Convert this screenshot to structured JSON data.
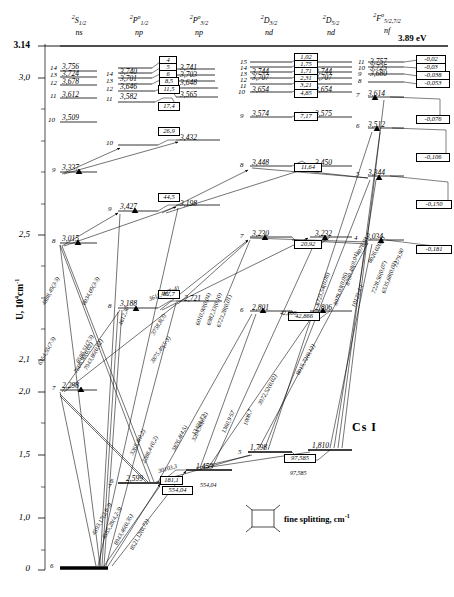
{
  "title": "Cs I",
  "axis": {
    "title": "U, 10⁴ cm⁻¹",
    "ticks": [
      "3.14",
      "3,0",
      "2,5",
      "2,1",
      "2,0",
      "1,5",
      "1,0",
      "0"
    ],
    "ionization_energy": "3.89 eV"
  },
  "legend": {
    "symbol": "fine-splitting-box",
    "text": "fine splitting, cm",
    "exp": "-1"
  },
  "columns": [
    {
      "term": "2S1/2",
      "term_sup": "2",
      "term_letter": "S",
      "term_sub": "1/2",
      "conf": "ns"
    },
    {
      "term": "2P°1/2",
      "term_sup": "2",
      "term_letter": "P",
      "term_sub": "1/2",
      "conf": "np"
    },
    {
      "term": "2P°3/2",
      "term_sup": "2",
      "term_letter": "P",
      "term_sub": "3/2",
      "conf": "np"
    },
    {
      "term": "2D3/2",
      "term_sup": "2",
      "term_letter": "D",
      "term_sub": "3/2",
      "conf": "nd"
    },
    {
      "term": "2D5/2",
      "term_sup": "2",
      "term_letter": "D",
      "term_sub": "5/2",
      "conf": "nd"
    },
    {
      "term": "2F°5/2,7/2",
      "term_sup": "2",
      "term_letter": "F",
      "term_sub": "5/2,7/2",
      "conf": "nf"
    }
  ],
  "levels": {
    "ns": [
      {
        "n": "14",
        "value": "3,756"
      },
      {
        "n": "13",
        "value": "3,724"
      },
      {
        "n": "12",
        "value": "3,678"
      },
      {
        "n": "11",
        "value": "3,612"
      },
      {
        "n": "10",
        "value": "3,509"
      },
      {
        "n": "9",
        "value": "3,337"
      },
      {
        "n": "8",
        "value": "3,015"
      },
      {
        "n": "7",
        "value": "2,298"
      },
      {
        "n": "6",
        "value": ""
      }
    ],
    "np12": [
      {
        "n": "14",
        "value": "3,740"
      },
      {
        "n": "13",
        "value": "3,701"
      },
      {
        "n": "12",
        "value": "3,646"
      },
      {
        "n": "11",
        "value": "3,582"
      },
      {
        "n": "10",
        "value": ""
      },
      {
        "n": "9",
        "value": "3,427"
      },
      {
        "n": "8",
        "value": "3,188"
      },
      {
        "n": "7",
        "value": "2,599"
      },
      {
        "n": "6",
        "value": "1,386"
      }
    ],
    "np32": [
      {
        "n": "",
        "value": "3,741"
      },
      {
        "n": "",
        "value": "3,703"
      },
      {
        "n": "",
        "value": "3,648"
      },
      {
        "n": "",
        "value": "3,565"
      },
      {
        "n": "",
        "value": "3,432"
      },
      {
        "n": "",
        "value": "3,198"
      },
      {
        "n": "",
        "value": "2,721"
      },
      {
        "n": "",
        "value": "1,453"
      }
    ],
    "nd32": [
      {
        "n": "15",
        "value": ""
      },
      {
        "n": "14",
        "value": ""
      },
      {
        "n": "13",
        "value": "3,744"
      },
      {
        "n": "12",
        "value": "3,707"
      },
      {
        "n": "11",
        "value": ""
      },
      {
        "n": "10",
        "value": "3,654"
      },
      {
        "n": "9",
        "value": "3,574"
      },
      {
        "n": "8",
        "value": "3,448"
      },
      {
        "n": "7",
        "value": "3,230"
      },
      {
        "n": "6",
        "value": "2,801"
      },
      {
        "n": "5",
        "value": "1,798"
      }
    ],
    "nd52": [
      {
        "n": "",
        "value": "3,744"
      },
      {
        "n": "",
        "value": "3,707"
      },
      {
        "n": "",
        "value": "3,654"
      },
      {
        "n": "",
        "value": "3,575"
      },
      {
        "n": "",
        "value": "3,450"
      },
      {
        "n": "",
        "value": "3,232"
      },
      {
        "n": "",
        "value": "2,806"
      },
      {
        "n": "",
        "value": "1,810"
      }
    ],
    "nf": [
      {
        "n": "11",
        "value": "3,757"
      },
      {
        "n": "10",
        "value": "3,725"
      },
      {
        "n": "9",
        "value": "3,680"
      },
      {
        "n": "8",
        "value": ""
      },
      {
        "n": "7",
        "value": "3,614"
      },
      {
        "n": "6",
        "value": "3,512"
      },
      {
        "n": "5",
        "value": "3,344"
      },
      {
        "n": "4",
        "value": "3,034"
      }
    ]
  },
  "fine_splitting": {
    "np": [
      "4",
      "5",
      "6",
      "8,5",
      "11,5",
      "17,4",
      "26,9",
      "44,5",
      "82,7",
      "181,1",
      "554,04"
    ],
    "nd": [
      "1,02",
      "1,75",
      "1,71",
      "2,31",
      "3,21",
      "4,85",
      "7,17",
      "11,64",
      "20,92",
      "42,866",
      "97,585"
    ],
    "nf": [
      "-0,02",
      "-0,03",
      "-0,038",
      "-0,053",
      "-0,076",
      "-0,106",
      "-0,150",
      "-0,181"
    ]
  },
  "transitions": [
    {
      "label": "4888,49(3·3)",
      "x": 46,
      "y": 300,
      "rot": -62
    },
    {
      "label": "6354,55(7·3)",
      "x": 42,
      "y": 360,
      "rot": -62
    },
    {
      "label": "6034,09(3·3)",
      "x": 86,
      "y": 300,
      "rot": -62
    },
    {
      "label": "6586,51(7·3)",
      "x": 80,
      "y": 358,
      "rot": -62
    },
    {
      "label": "7943,86(0,02)",
      "x": 88,
      "y": 365,
      "rot": -62
    },
    {
      "label": "7608,90(0,02)",
      "x": 78,
      "y": 368,
      "rot": -62
    },
    {
      "label": "4612,30",
      "x": 123,
      "y": 320,
      "rot": -70
    },
    {
      "label": "3611,46(7··4)",
      "x": 150,
      "y": 296,
      "rot": -22
    },
    {
      "label": "3875,49(5·3)",
      "x": 154,
      "y": 358,
      "rot": -55
    },
    {
      "label": "6010,90(0,04)",
      "x": 200,
      "y": 320,
      "rot": -70
    },
    {
      "label": "6982,33(0,10)",
      "x": 211,
      "y": 320,
      "rot": -70
    },
    {
      "label": "6723,28(0,01)",
      "x": 221,
      "y": 322,
      "rot": -70
    },
    {
      "label": "3758,8(3)",
      "x": 155,
      "y": 330,
      "rot": -60
    },
    {
      "label": "42,866",
      "x": 280,
      "y": 310,
      "rot": 0
    },
    {
      "label": "3972,52(0,02)",
      "x": 262,
      "y": 400,
      "rot": -62
    },
    {
      "label": "8015,72(0,12)",
      "x": 300,
      "y": 370,
      "rot": -62
    },
    {
      "label": "6723,54(0,06)",
      "x": 320,
      "y": 300,
      "rot": -72
    },
    {
      "label": "8079,03(0,06)",
      "x": 338,
      "y": 300,
      "rot": -72
    },
    {
      "label": "8700,48(0,04)",
      "x": 350,
      "y": 280,
      "rot": -74
    },
    {
      "label": "4078,93",
      "x": 360,
      "y": 250,
      "rot": -62
    },
    {
      "label": "8026,020(3)",
      "x": 372,
      "y": 258,
      "rot": -62
    },
    {
      "label": "7279,90",
      "x": 398,
      "y": 262,
      "rot": -70
    },
    {
      "label": "6535,68(0,02)",
      "x": 386,
      "y": 288,
      "rot": -70
    },
    {
      "label": "7228,56(0,07)",
      "x": 376,
      "y": 288,
      "rot": -70
    },
    {
      "label": "10123,4·1",
      "x": 356,
      "y": 302,
      "rot": -70
    },
    {
      "label": "1360,9·57",
      "x": 226,
      "y": 428,
      "rot": -66
    },
    {
      "label": "1008,7",
      "x": 248,
      "y": 420,
      "rot": -72
    },
    {
      "label": "13424,72",
      "x": 196,
      "y": 430,
      "rot": -62
    },
    {
      "label": "30103,3",
      "x": 159,
      "y": 468,
      "rot": -16
    },
    {
      "label": "3876,4(4,5)",
      "x": 176,
      "y": 446,
      "rot": -64
    },
    {
      "label": "3204,56(0,2)",
      "x": 196,
      "y": 436,
      "rot": -66
    },
    {
      "label": "2288,4·(0,2)",
      "x": 146,
      "y": 458,
      "rot": -64
    },
    {
      "label": "3265,4(0,2)",
      "x": 134,
      "y": 450,
      "rot": -64
    },
    {
      "label": "4593,17(2,8·3)",
      "x": 96,
      "y": 530,
      "rot": -62
    },
    {
      "label": "4555,28(4,2·3)",
      "x": 106,
      "y": 534,
      "rot": -62
    },
    {
      "label": "8943,46(0,35)",
      "x": 118,
      "y": 540,
      "rot": -62
    },
    {
      "label": "8521,12(0,72)",
      "x": 134,
      "y": 545,
      "rot": -62
    },
    {
      "label": "554,04",
      "x": 200,
      "y": 482,
      "rot": 0
    },
    {
      "label": "97,585",
      "x": 290,
      "y": 470,
      "rot": 0
    }
  ]
}
